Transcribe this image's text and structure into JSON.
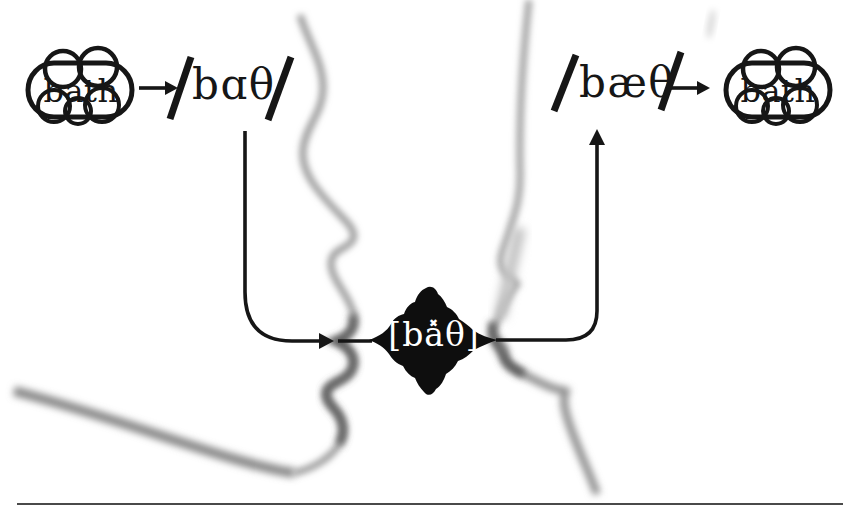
{
  "figure": {
    "speaker": {
      "thought_word": "bath",
      "phonemic_form": "bɑθ",
      "slash": "/"
    },
    "signal": {
      "phonetic_form": "[ba̽θ]"
    },
    "hearer": {
      "phonemic_form": "bæθ",
      "slash": "/",
      "thought_word": "bath"
    },
    "colors": {
      "ink": "#161616",
      "face_shadow": "#9e9e9e",
      "face_shadow_dark": "#5a5a5a",
      "burst_fill": "#0e0e0e",
      "burst_text": "#ffffff",
      "baseline_rule": "#4a4a4a",
      "background": "#ffffff"
    }
  }
}
